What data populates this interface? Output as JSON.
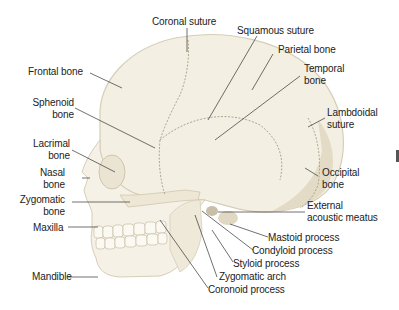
{
  "colors": {
    "bone": "#f3efe2",
    "bone_shadow": "#d9d1bd",
    "suture": "#a89f88",
    "leader_line": "#333333",
    "text": "#222222"
  },
  "labels": {
    "coronal_suture": "Coronal suture",
    "squamous_suture": "Squamous suture",
    "parietal_bone": "Parietal bone",
    "temporal_bone": "Temporal\nbone",
    "lambdoidal_suture": "Lambdoidal\nsuture",
    "frontal_bone": "Frontal bone",
    "sphenoid_bone": "Sphenoid\nbone",
    "lacrimal_bone": "Lacrimal\nbone",
    "nasal_bone": "Nasal\nbone",
    "zygomatic_bone": "Zygomatic\nbone",
    "maxilla": "Maxilla",
    "mandible": "Mandible",
    "occipital_bone": "Occipital\nbone",
    "external_acoustic_meatus": "External\nacoustic meatus",
    "mastoid_process": "Mastoid process",
    "condyloid_process": "Condyloid process",
    "styloid_process": "Styloid process",
    "zygomatic_arch": "Zygomatic arch",
    "coronoid_process": "Coronoid process"
  }
}
